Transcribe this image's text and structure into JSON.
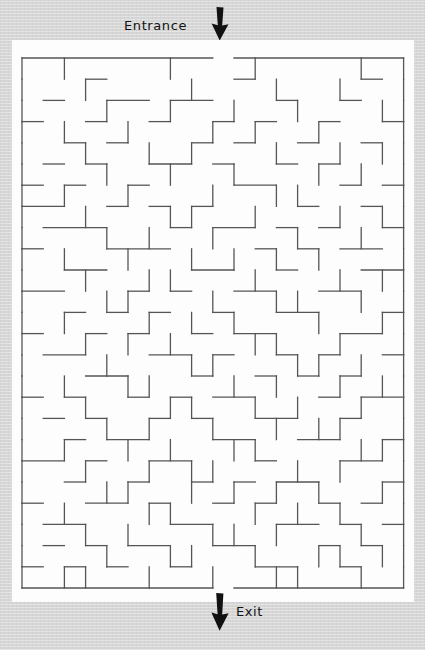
{
  "page": {
    "background_color": "#d6d6d6",
    "paper_color": "#fdfdfd",
    "wall_color": "#555555",
    "ink_color": "#111111"
  },
  "annotations": {
    "entrance_label": "Entrance",
    "exit_label": "Exit",
    "entrance_arrow_icon": "arrow-down-icon",
    "exit_arrow_icon": "arrow-down-icon"
  },
  "maze": {
    "cols": 18,
    "rows": 25,
    "cell": 21.2,
    "origin_x": 10,
    "origin_y": 18,
    "wall_width": 1.3,
    "entrance_col": 9,
    "exit_col": 9,
    "entrance_side": "top",
    "exit_side": "bottom",
    "h_walls": [
      "111111111011111111",
      "000100000010000010",
      "010011011000100100",
      "100100100101001001",
      "001010001010010010",
      "010100110100101000",
      "101001000011000101",
      "110010101000010010",
      "011100010110101001",
      "100011100001010110",
      "001100001100100011",
      "110001010011001100",
      "001010100100110001",
      "100101001011000110",
      "011000110100101001",
      "000110001001010100",
      "101001010110001011",
      "010100101001100100",
      "001011000110011001",
      "110100110001000110",
      "001001001010110001",
      "100110100101001010",
      "011000011000110101",
      "010101100110001010",
      "101010010001100100",
      "111111111011111111"
    ],
    "v_walls": [
      "1010000100010000101",
      "1001000010001001001",
      "1000100100100100011",
      "1010010001010010001",
      "1001001010001001011",
      "1000100100100010101",
      "1010010001001100001",
      "1001000110010001011",
      "1000101001000100101",
      "1010010010101010001",
      "1001001100010001011",
      "1000110001001100101",
      "1010001010100010011",
      "1001010100011001001",
      "1000100011000110101",
      "1010011000101001011",
      "1001000110010100101",
      "1000101001001011001",
      "1010010100110000111",
      "1001001011000101001",
      "1000110010101010011",
      "1010001100010101001",
      "1001010001101000101",
      "1000100110010011011",
      "1011001001001100101"
    ]
  }
}
